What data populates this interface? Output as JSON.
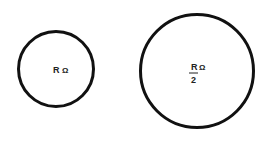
{
  "diagram": {
    "circles": [
      {
        "id": "small",
        "cx": 56,
        "cy": 69,
        "r": 38,
        "label": "R",
        "unit": "Ω"
      },
      {
        "id": "large",
        "cx": 197,
        "cy": 71,
        "r": 57,
        "label_numerator": "R",
        "label_denominator": "2",
        "unit": "Ω"
      }
    ],
    "stroke_color": "#111111"
  }
}
